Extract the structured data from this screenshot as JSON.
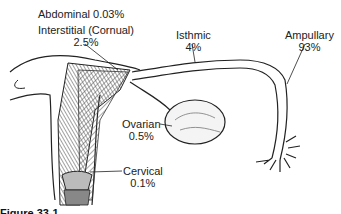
{
  "figure": {
    "caption_visible": "Figure 33-1"
  },
  "labels": [
    {
      "id": "abdominal",
      "name": "Abdominal",
      "value": "0.03%",
      "text": "Abdominal 0.03%"
    },
    {
      "id": "interstitial",
      "name": "Interstitial (Cornual)",
      "value": "2.5%"
    },
    {
      "id": "isthmic",
      "name": "Isthmic",
      "value": "4%"
    },
    {
      "id": "ampullary",
      "name": "Ampullary",
      "value": "93%"
    },
    {
      "id": "ovarian",
      "name": "Ovarian",
      "value": "0.5%"
    },
    {
      "id": "cervical",
      "name": "Cervical",
      "value": "0.1%"
    }
  ]
}
